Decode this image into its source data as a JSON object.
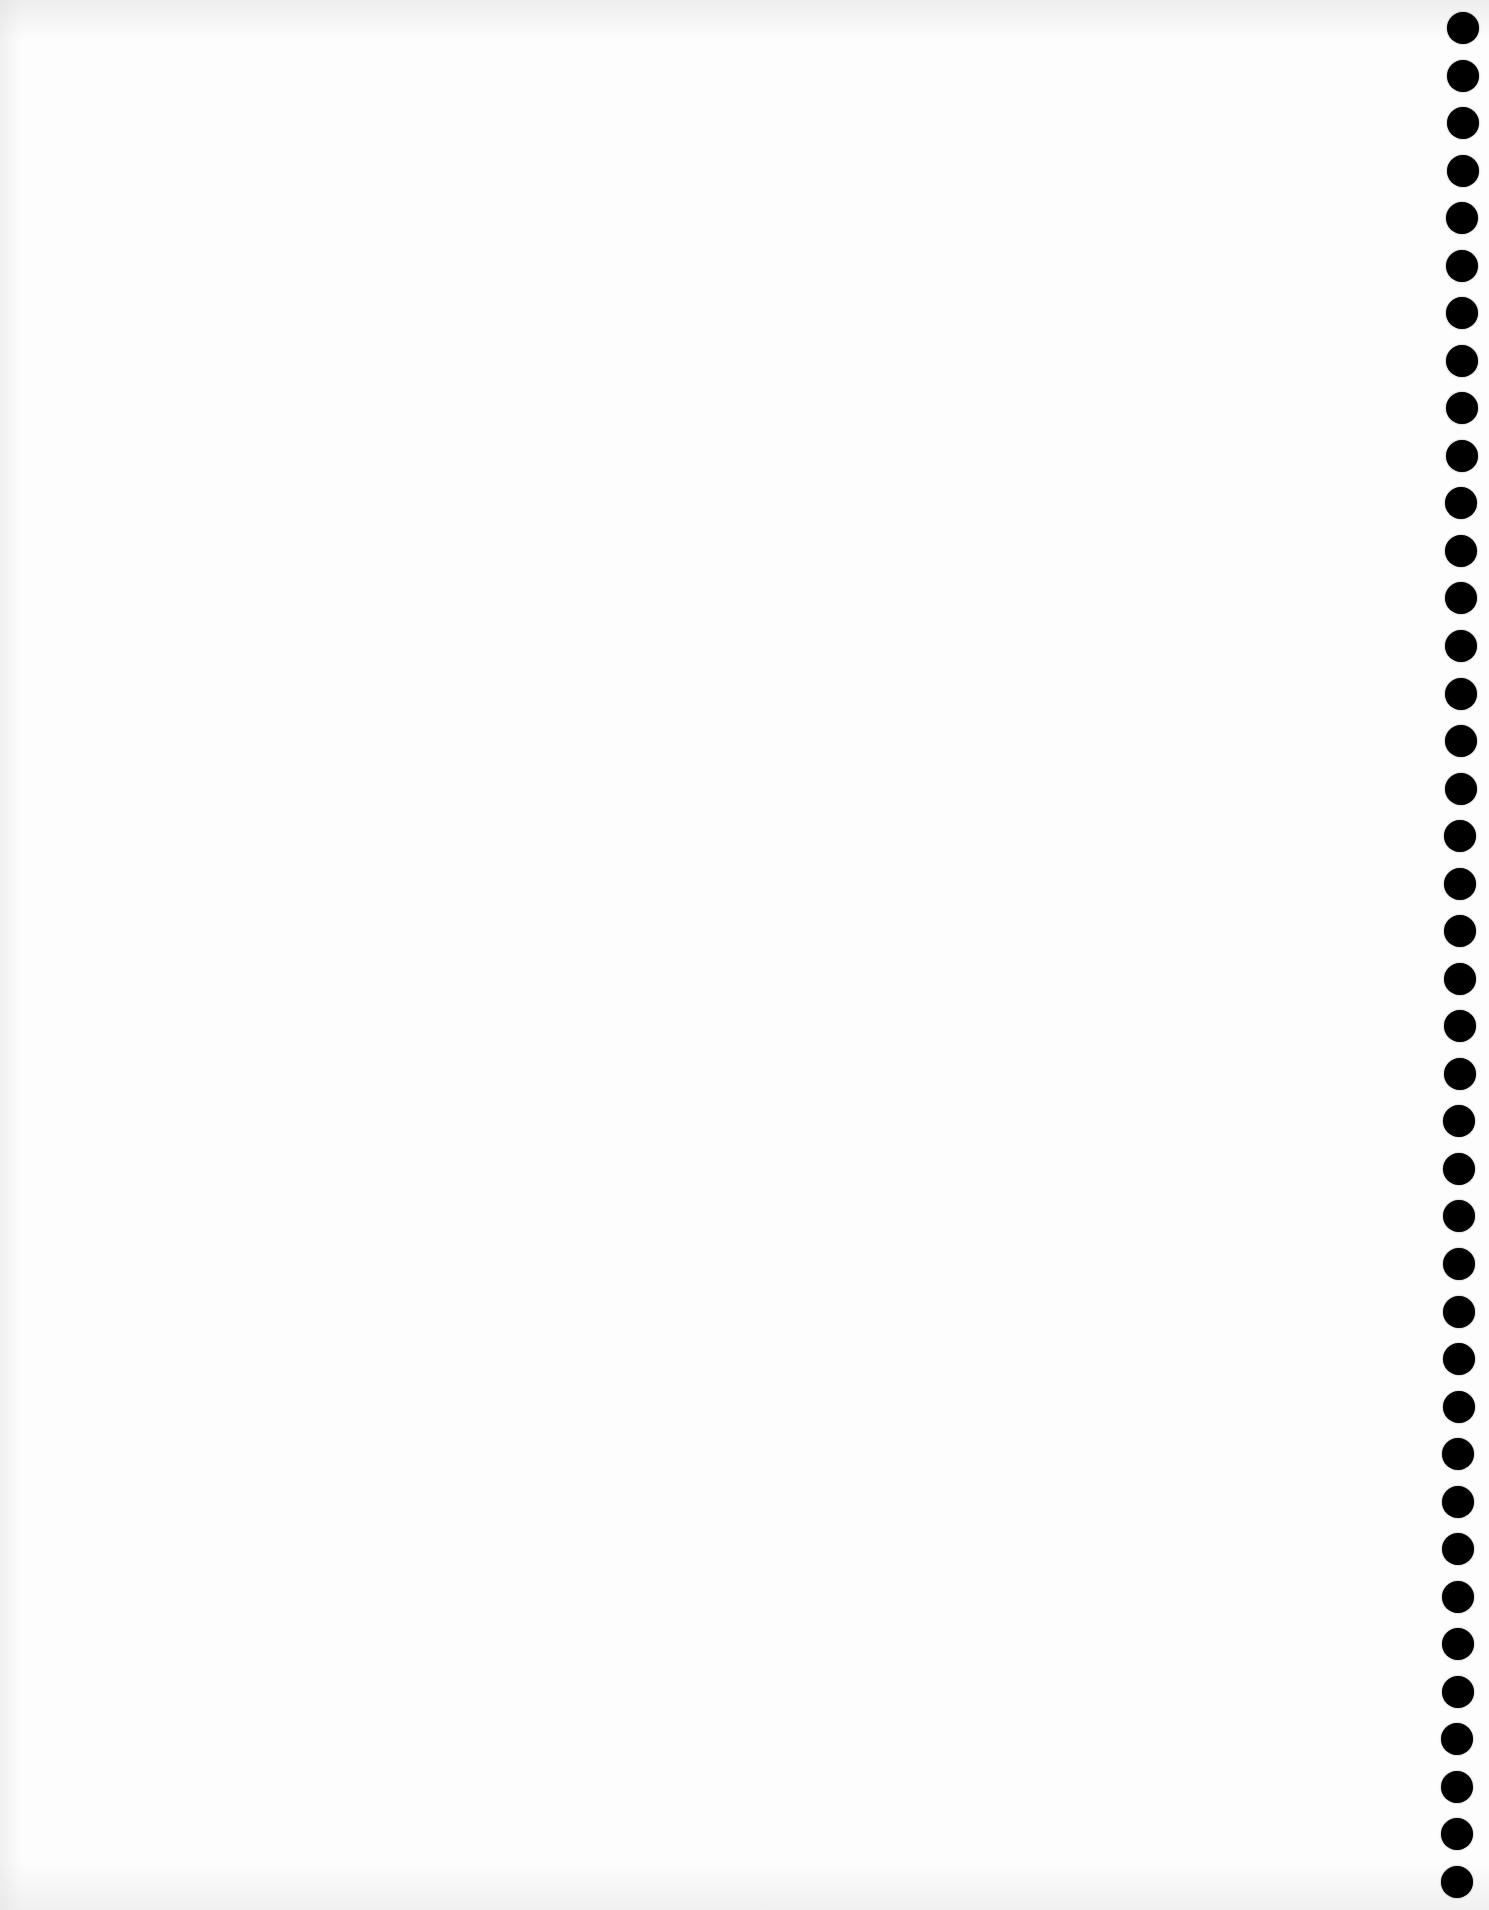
{
  "page": {
    "type": "blank scanned page",
    "background_color": "#fdfdfd",
    "text_content": ""
  },
  "punch_holes": {
    "count": 40,
    "color": "#000000",
    "diameter_px": 32,
    "first_center_y": 28,
    "last_center_y": 1882,
    "center_x_top": 1463,
    "center_x_bottom": 1457
  }
}
